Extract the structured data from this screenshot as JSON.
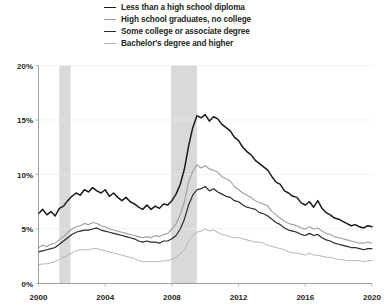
{
  "chart_data": {
    "type": "line",
    "title": "",
    "subtitle": "",
    "xlabel": "",
    "ylabel": "",
    "xlim": [
      2000.0,
      2020.0
    ],
    "ylim": [
      0,
      20
    ],
    "yticks": [
      0,
      5,
      10,
      15,
      20
    ],
    "ytick_labels": [
      "0%",
      "5%",
      "10%",
      "15%",
      "20%"
    ],
    "xticks": [
      2000,
      2004,
      2008,
      2012,
      2016,
      2020
    ],
    "xtick_labels": [
      "2000",
      "2004",
      "2008",
      "2012",
      "2016",
      "2020"
    ],
    "grid": true,
    "legend_position": "top-center",
    "annotations": [
      {
        "name": "recession-band-2001",
        "x_start": 2001.25,
        "x_end": 2001.92,
        "label": ""
      },
      {
        "name": "recession-band-2008",
        "x_start": 2007.95,
        "x_end": 2009.5,
        "label": ""
      }
    ],
    "x": [
      2000.0,
      2000.25,
      2000.5,
      2000.75,
      2001.0,
      2001.25,
      2001.5,
      2001.75,
      2002.0,
      2002.25,
      2002.5,
      2002.75,
      2003.0,
      2003.25,
      2003.5,
      2003.75,
      2004.0,
      2004.25,
      2004.5,
      2004.75,
      2005.0,
      2005.25,
      2005.5,
      2005.75,
      2006.0,
      2006.25,
      2006.5,
      2006.75,
      2007.0,
      2007.25,
      2007.5,
      2007.75,
      2008.0,
      2008.25,
      2008.5,
      2008.75,
      2009.0,
      2009.25,
      2009.5,
      2009.75,
      2010.0,
      2010.25,
      2010.5,
      2010.75,
      2011.0,
      2011.25,
      2011.5,
      2011.75,
      2012.0,
      2012.25,
      2012.5,
      2012.75,
      2013.0,
      2013.25,
      2013.5,
      2013.75,
      2014.0,
      2014.25,
      2014.5,
      2014.75,
      2015.0,
      2015.25,
      2015.5,
      2015.75,
      2016.0,
      2016.25,
      2016.5,
      2016.75,
      2017.0,
      2017.25,
      2017.5,
      2017.75,
      2018.0,
      2018.25,
      2018.5,
      2018.75,
      2019.0,
      2019.25,
      2019.5,
      2019.75,
      2020.0
    ],
    "series": [
      {
        "name": "Less than a high school diploma",
        "color": "#1a1a1a",
        "width": 1.5,
        "values": [
          6.4,
          6.8,
          6.3,
          6.6,
          6.2,
          6.9,
          7.1,
          7.6,
          8.0,
          8.3,
          8.1,
          8.6,
          8.4,
          8.8,
          8.5,
          8.3,
          8.6,
          8.0,
          8.3,
          7.9,
          7.6,
          7.9,
          7.5,
          7.3,
          7.0,
          6.8,
          7.2,
          6.8,
          7.1,
          6.9,
          7.3,
          7.2,
          7.6,
          8.2,
          9.1,
          10.5,
          12.6,
          14.3,
          15.4,
          15.2,
          15.5,
          14.9,
          15.3,
          15.1,
          14.6,
          14.3,
          14.0,
          13.4,
          13.1,
          12.5,
          12.1,
          11.8,
          11.3,
          11.0,
          10.7,
          10.4,
          9.8,
          9.3,
          9.1,
          8.5,
          8.3,
          8.0,
          7.9,
          7.4,
          7.2,
          7.5,
          7.0,
          7.6,
          6.9,
          6.5,
          6.3,
          6.0,
          5.9,
          5.7,
          5.5,
          5.3,
          5.4,
          5.2,
          5.1,
          5.3,
          5.2
        ]
      },
      {
        "name": "High school graduates, no college",
        "color": "#9e9e9e",
        "width": 1.1,
        "values": [
          3.3,
          3.5,
          3.4,
          3.6,
          3.7,
          4.0,
          4.3,
          4.7,
          5.0,
          5.2,
          5.3,
          5.5,
          5.4,
          5.6,
          5.5,
          5.3,
          5.2,
          5.0,
          4.9,
          4.8,
          4.7,
          4.6,
          4.5,
          4.4,
          4.3,
          4.2,
          4.3,
          4.2,
          4.4,
          4.3,
          4.5,
          4.6,
          5.0,
          5.5,
          6.3,
          7.5,
          9.3,
          10.3,
          10.9,
          10.6,
          10.8,
          10.5,
          10.4,
          10.2,
          9.8,
          9.6,
          9.4,
          8.9,
          8.6,
          8.3,
          8.1,
          7.9,
          7.6,
          7.4,
          7.3,
          7.1,
          6.6,
          6.3,
          6.0,
          5.7,
          5.5,
          5.4,
          5.3,
          5.1,
          5.0,
          5.2,
          5.0,
          5.1,
          4.8,
          4.6,
          4.5,
          4.3,
          4.2,
          4.1,
          4.0,
          3.9,
          3.8,
          3.7,
          3.7,
          3.8,
          3.7
        ]
      },
      {
        "name": "Some college or associate degree",
        "color": "#2b2b2b",
        "width": 1.2,
        "values": [
          2.9,
          3.0,
          3.1,
          3.2,
          3.3,
          3.6,
          3.9,
          4.2,
          4.5,
          4.7,
          4.8,
          4.9,
          4.9,
          5.0,
          5.1,
          4.9,
          4.8,
          4.7,
          4.6,
          4.5,
          4.4,
          4.3,
          4.2,
          4.1,
          3.9,
          3.8,
          3.9,
          3.8,
          3.8,
          3.7,
          3.9,
          3.9,
          4.1,
          4.4,
          5.0,
          5.9,
          7.2,
          8.1,
          8.6,
          8.7,
          8.9,
          8.5,
          8.7,
          8.4,
          8.2,
          8.0,
          7.9,
          7.6,
          7.5,
          7.2,
          7.0,
          6.9,
          6.8,
          6.5,
          6.4,
          6.2,
          5.9,
          5.6,
          5.4,
          5.1,
          4.9,
          4.8,
          4.7,
          4.5,
          4.4,
          4.6,
          4.4,
          4.5,
          4.2,
          4.0,
          3.9,
          3.7,
          3.6,
          3.5,
          3.4,
          3.3,
          3.3,
          3.2,
          3.1,
          3.2,
          3.2
        ]
      },
      {
        "name": "Bachelor's degree and higher",
        "color": "#b5b5b5",
        "width": 1.0,
        "values": [
          1.7,
          1.8,
          1.8,
          1.9,
          2.0,
          2.2,
          2.4,
          2.6,
          2.8,
          3.0,
          3.1,
          3.1,
          3.1,
          3.2,
          3.2,
          3.1,
          3.0,
          2.9,
          2.8,
          2.7,
          2.6,
          2.5,
          2.4,
          2.3,
          2.1,
          2.0,
          2.0,
          2.0,
          2.0,
          2.0,
          2.1,
          2.1,
          2.2,
          2.4,
          2.7,
          3.1,
          3.9,
          4.4,
          4.7,
          4.8,
          5.0,
          4.8,
          4.9,
          4.7,
          4.5,
          4.4,
          4.3,
          4.2,
          4.2,
          4.1,
          4.0,
          3.9,
          3.8,
          3.8,
          3.7,
          3.5,
          3.4,
          3.3,
          3.2,
          3.1,
          2.9,
          2.8,
          2.8,
          2.7,
          2.6,
          2.8,
          2.6,
          2.6,
          2.5,
          2.4,
          2.4,
          2.3,
          2.2,
          2.2,
          2.1,
          2.1,
          2.1,
          2.1,
          2.0,
          2.1,
          2.1
        ]
      }
    ]
  },
  "legend": {
    "items": [
      {
        "label": "Less than a high school diploma"
      },
      {
        "label": "High school graduates, no college"
      },
      {
        "label": "Some college or associate degree"
      },
      {
        "label": "Bachelor's degree and higher"
      }
    ]
  }
}
